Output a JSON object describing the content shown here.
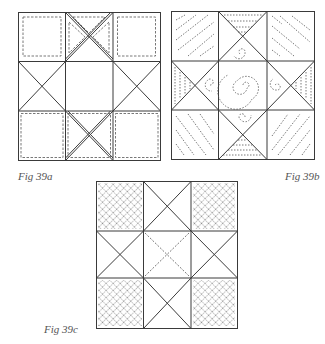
{
  "figures": [
    {
      "id": "a",
      "caption": "Fig 39a",
      "description": "Nine-patch star block; corner squares with inset dashed squares, top and bottom middle cells with doubled diagonal X quilting, side cells plain X, center plain square"
    },
    {
      "id": "b",
      "caption": "Fig 39b",
      "description": "Nine-patch star block; corner squares with diagonal dashed lines, side triangles with parallel dashed lines, spiral quilting in center and inner triangles"
    },
    {
      "id": "c",
      "caption": "Fig 39c",
      "description": "Nine-patch star block; corner squares with dense crosshatch stippling, center with dashed X, other cells plain X"
    }
  ],
  "colors": {
    "line": "#3a3a3a",
    "dash": "#555555",
    "caption": "#555555",
    "background": "#ffffff"
  }
}
